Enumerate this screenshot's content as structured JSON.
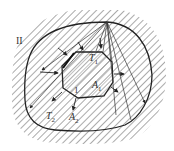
{
  "diagram": {
    "type": "radiation-enclosure",
    "outer_surface": {
      "region_label": "II",
      "temperature_label": "T",
      "temperature_sub": "2",
      "area_label": "A",
      "area_sub": "2"
    },
    "inner_body": {
      "region_label": "1",
      "temperature_label": "T",
      "temperature_sub": "1",
      "area_label": "A",
      "area_sub": "1"
    },
    "colors": {
      "line": "#222222",
      "hatch": "#555555",
      "background": "#ffffff"
    }
  }
}
